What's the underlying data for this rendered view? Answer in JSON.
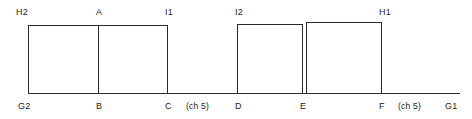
{
  "diagram": {
    "type": "step-profile-line-drawing",
    "stroke_color": "#2b2b2b",
    "background_color": "#ffffff",
    "stroke_width": 1,
    "baseline": {
      "y": 93,
      "x_start": 28,
      "x_end": 460
    },
    "top_vertices": [
      {
        "id": "H2",
        "label": "H2",
        "x": 28,
        "y": 25,
        "label_x": 16,
        "label_y": 7
      },
      {
        "id": "A",
        "label": "A",
        "x": 98,
        "y": 25,
        "label_x": 96,
        "label_y": 7
      },
      {
        "id": "I1",
        "label": "I1",
        "x": 167,
        "y": 25,
        "label_x": 165,
        "label_y": 7
      },
      {
        "id": "I2",
        "label": "I2",
        "x": 237,
        "y": 24,
        "label_x": 235,
        "label_y": 7
      },
      {
        "id": "H1",
        "label": "H1",
        "x": 381,
        "y": 22,
        "label_x": 379,
        "label_y": 7
      }
    ],
    "bottom_vertices": [
      {
        "id": "G2",
        "label": "G2",
        "x": 28,
        "y": 93,
        "label_x": 18,
        "label_y": 101
      },
      {
        "id": "B",
        "label": "B",
        "x": 98,
        "y": 93,
        "label_x": 96,
        "label_y": 101
      },
      {
        "id": "C",
        "label": "C",
        "x": 167,
        "y": 93,
        "label_x": 165,
        "label_y": 101
      },
      {
        "id": "D",
        "label": "D",
        "x": 237,
        "y": 93,
        "label_x": 235,
        "label_y": 101
      },
      {
        "id": "E",
        "label": "E",
        "x": 302,
        "y": 93,
        "label_x": 300,
        "label_y": 101
      },
      {
        "id": "F",
        "label": "F",
        "x": 381,
        "y": 93,
        "label_x": 379,
        "label_y": 101
      },
      {
        "id": "G1",
        "label": "G1",
        "x": 460,
        "y": 93,
        "label_x": 445,
        "label_y": 101
      }
    ],
    "segment_notes": [
      {
        "id": "note-cd",
        "label": "(ch 5)",
        "label_x": 186,
        "label_y": 101
      },
      {
        "id": "note-fg1",
        "label": "(ch 5)",
        "label_x": 398,
        "label_y": 101
      }
    ],
    "blocks": [
      {
        "id": "block-left",
        "left": 28,
        "right": 167,
        "top": 25,
        "bottom": 93,
        "divider_x": 98
      },
      {
        "id": "block-mid",
        "left": 237,
        "right": 302,
        "top": 24,
        "bottom": 93,
        "divider_x": null
      },
      {
        "id": "block-right",
        "left": 306,
        "right": 381,
        "top": 22,
        "bottom": 93,
        "divider_x": null
      }
    ]
  }
}
